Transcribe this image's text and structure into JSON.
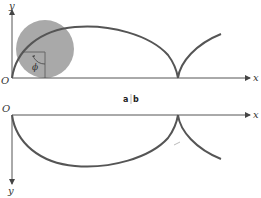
{
  "figure": {
    "panel_separator_label": {
      "a": "a",
      "sep": "|",
      "b": "b"
    },
    "top_panel": {
      "x_axis_label": "x",
      "y_axis_label": "y",
      "origin_label": "O",
      "angle_label": "ϕ",
      "description": "Cycloid traced by a point on a rolling circle; arch from origin to cusp, then next arch begins"
    },
    "bottom_panel": {
      "x_axis_label": "x",
      "y_axis_label": "y",
      "origin_label": "O",
      "description": "Inverted cycloid (y axis pointing down)"
    },
    "colors": {
      "curve": "#555555",
      "axis": "#555555",
      "circle_fill": "#a9a9a9",
      "background": "#ffffff"
    }
  }
}
